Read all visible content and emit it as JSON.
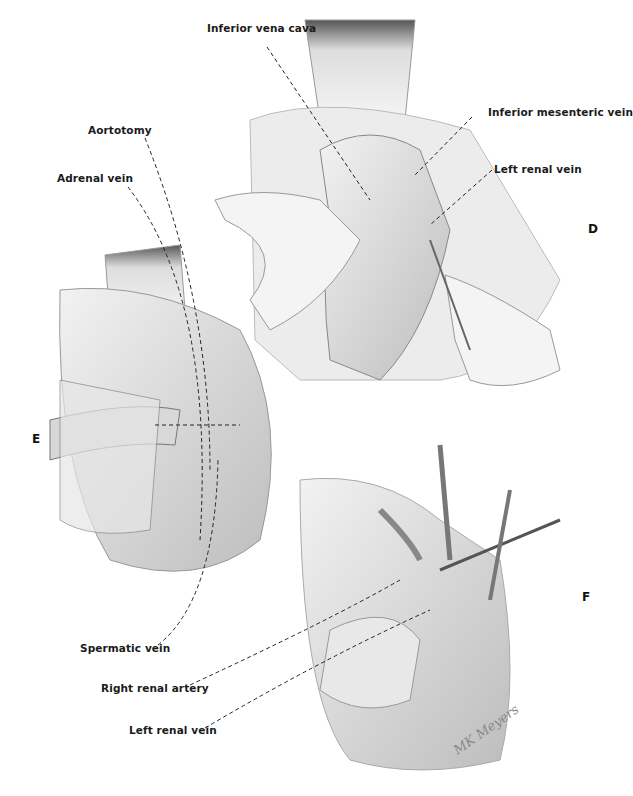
{
  "figure": {
    "panels": [
      {
        "id": "D",
        "label": "D"
      },
      {
        "id": "E",
        "label": "E"
      },
      {
        "id": "F",
        "label": "F"
      }
    ],
    "labels": {
      "inferior_vena_cava": "Inferior vena cava",
      "inferior_mesenteric_vein": "Inferior mesenteric vein",
      "left_renal_vein_d": "Left renal vein",
      "aortotomy": "Aortotomy",
      "adrenal_vein": "Adrenal vein",
      "spermatic_vein": "Spermatic vein",
      "right_renal_artery": "Right renal artery",
      "left_renal_vein_f": "Left renal vein"
    },
    "signature": "MK Meyers"
  }
}
